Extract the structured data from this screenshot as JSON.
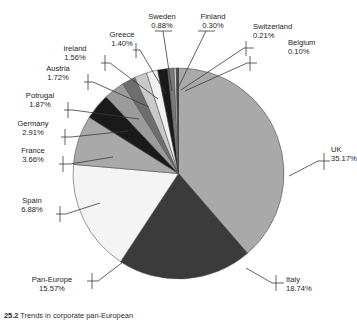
{
  "figure": {
    "caption_number": "25.2",
    "caption_text": "Trends in corporate pan-European"
  },
  "chart_data": {
    "type": "pie",
    "title": "",
    "legend": "labels-with-leader-lines",
    "unit": "percent",
    "categories": [
      "UK",
      "Italy",
      "Pan-Europe",
      "Spain",
      "France",
      "Germany",
      "Potrugal",
      "Austria",
      "Ireland",
      "Greece",
      "Sweden",
      "Finland",
      "Switzerland",
      "Belgium"
    ],
    "values": [
      35.17,
      18.74,
      15.57,
      6.88,
      3.66,
      2.91,
      1.87,
      1.72,
      1.56,
      1.4,
      0.88,
      0.3,
      0.21,
      0.1
    ],
    "value_labels": [
      "35.17%",
      "18.74%",
      "15.57%",
      "6.88%",
      "3.66%",
      "2.91%",
      "1.87%",
      "1.72%",
      "1.56%",
      "1.40%",
      "0.88%",
      "0.30%",
      "0.21%",
      "0.10%"
    ],
    "colors": [
      "#a9a9a9",
      "#3b3b3b",
      "#f4f4f4",
      "#a9a9a9",
      "#1a1a1a",
      "#9b9b9b",
      "#6e6e6e",
      "#c9c9c9",
      "#f2f2f2",
      "#1a1a1a",
      "#7a7a7a",
      "#d8d8d8",
      "#3b3b3b",
      "#111111"
    ],
    "start_angle_deg": 0,
    "direction": "clockwise"
  },
  "slices": [
    {
      "name": "UK",
      "pct": "35.17%",
      "color": "#a9a9a9"
    },
    {
      "name": "Italy",
      "pct": "18.74%",
      "color": "#3b3b3b"
    },
    {
      "name": "Pan-Europe",
      "pct": "15.57%",
      "color": "#f4f4f4"
    },
    {
      "name": "Spain",
      "pct": "6.88%",
      "color": "#a9a9a9"
    },
    {
      "name": "France",
      "pct": "3.66%",
      "color": "#1a1a1a"
    },
    {
      "name": "Germany",
      "pct": "2.91%",
      "color": "#9b9b9b"
    },
    {
      "name": "Potrugal",
      "pct": "1.87%",
      "color": "#6e6e6e"
    },
    {
      "name": "Austria",
      "pct": "1.72%",
      "color": "#c9c9c9"
    },
    {
      "name": "Ireland",
      "pct": "1.56%",
      "color": "#f2f2f2"
    },
    {
      "name": "Greece",
      "pct": "1.40%",
      "color": "#1a1a1a"
    },
    {
      "name": "Sweden",
      "pct": "0.88%",
      "color": "#7a7a7a"
    },
    {
      "name": "Finland",
      "pct": "0.30%",
      "color": "#d8d8d8"
    },
    {
      "name": "Switzerland",
      "pct": "0.21%",
      "color": "#3b3b3b"
    },
    {
      "name": "Belgium",
      "pct": "0.10%",
      "color": "#111111"
    }
  ]
}
